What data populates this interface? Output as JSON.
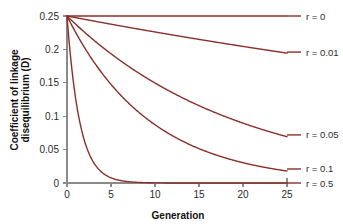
{
  "chart_data": {
    "type": "line",
    "title": "",
    "xlabel": "Generation",
    "ylabel": "Coefficient of linkage disequilibrium (D)",
    "ylabel_line1": "Coefficient of linkage",
    "ylabel_line2": "disequilibrium (D)",
    "xlim": [
      0,
      25
    ],
    "ylim": [
      0,
      0.25
    ],
    "xticks": [
      "0",
      "5",
      "10",
      "15",
      "20",
      "25"
    ],
    "xtick_values": [
      0,
      5,
      10,
      15,
      20,
      25
    ],
    "yticks": [
      "0",
      "0.05",
      "0.1",
      "0.15",
      "0.2",
      "0.25"
    ],
    "ytick_values": [
      0,
      0.05,
      0.1,
      0.15,
      0.2,
      0.25
    ],
    "grid": false,
    "legend_position": "right-inline",
    "curve_color": "#8c2f2a",
    "axis_color": "#8a8a8a",
    "background": "#ffffff",
    "x": [
      0,
      1,
      2,
      3,
      4,
      5,
      6,
      7,
      8,
      9,
      10,
      11,
      12,
      13,
      14,
      15,
      16,
      17,
      18,
      19,
      20,
      21,
      22,
      23,
      24,
      25
    ],
    "series": [
      {
        "name": "r = 0",
        "r": 0,
        "label": "r = 0",
        "label_y": 0.25,
        "values": [
          0.25,
          0.25,
          0.25,
          0.25,
          0.25,
          0.25,
          0.25,
          0.25,
          0.25,
          0.25,
          0.25,
          0.25,
          0.25,
          0.25,
          0.25,
          0.25,
          0.25,
          0.25,
          0.25,
          0.25,
          0.25,
          0.25,
          0.25,
          0.25,
          0.25,
          0.25
        ]
      },
      {
        "name": "r = 0.01",
        "r": 0.01,
        "label": "r = 0.01",
        "label_y": 0.196,
        "values": [
          0.25,
          0.2475,
          0.245,
          0.2426,
          0.2401,
          0.2377,
          0.2354,
          0.233,
          0.2307,
          0.2284,
          0.2261,
          0.2238,
          0.2216,
          0.2194,
          0.2172,
          0.215,
          0.2129,
          0.2107,
          0.2086,
          0.2065,
          0.2045,
          0.2024,
          0.2004,
          0.1984,
          0.1964,
          0.1945
        ]
      },
      {
        "name": "r = 0.05",
        "r": 0.05,
        "label": "r = 0.05",
        "label_y": 0.072,
        "values": [
          0.25,
          0.2375,
          0.2256,
          0.2143,
          0.2036,
          0.1934,
          0.1838,
          0.1746,
          0.1659,
          0.1576,
          0.1497,
          0.1422,
          0.1351,
          0.1284,
          0.1219,
          0.1158,
          0.11,
          0.1045,
          0.0993,
          0.0943,
          0.0896,
          0.0852,
          0.0809,
          0.0769,
          0.073,
          0.0694
        ]
      },
      {
        "name": "r = 0.1",
        "r": 0.1,
        "label": "r = 0.1",
        "label_y": 0.021,
        "values": [
          0.25,
          0.225,
          0.2025,
          0.1823,
          0.164,
          0.1476,
          0.1329,
          0.1196,
          0.1076,
          0.0969,
          0.0872,
          0.0784,
          0.0706,
          0.0635,
          0.0572,
          0.0515,
          0.0463,
          0.0417,
          0.0375,
          0.0338,
          0.0304,
          0.0273,
          0.0246,
          0.0221,
          0.0199,
          0.0179
        ]
      },
      {
        "name": "r = 0.5",
        "r": 0.5,
        "label": "r = 0.5",
        "label_y": 0.0,
        "values": [
          0.25,
          0.125,
          0.0625,
          0.0313,
          0.0156,
          0.0078,
          0.0039,
          0.002,
          0.001,
          0.0005,
          0.0002,
          0.0001,
          0.0001,
          0.0,
          0.0,
          0.0,
          0.0,
          0.0,
          0.0,
          0.0,
          0.0,
          0.0,
          0.0,
          0.0,
          0.0,
          0.0
        ]
      }
    ]
  }
}
